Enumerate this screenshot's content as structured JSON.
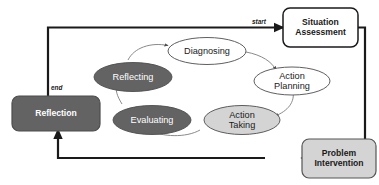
{
  "diagram": {
    "colors": {
      "dark_fill": "#636363",
      "light_fill": "#d4d4d4",
      "white_fill": "#ffffff",
      "stroke": "#1a1a1a",
      "thin_stroke": "#808080",
      "dark_text": "#ffffff",
      "light_text": "#1a1a1a"
    },
    "boxes": [
      {
        "id": "situation-assessment",
        "label": "Situation\nAssessment",
        "line1": "Situation",
        "line2": "Assessment",
        "fill": "#ffffff",
        "text_color": "#1a1a1a"
      },
      {
        "id": "problem-intervention",
        "label": "Problem\nIntervention",
        "line1": "Problem",
        "line2": "Intervention",
        "fill": "#d4d4d4",
        "text_color": "#1a1a1a"
      },
      {
        "id": "reflection",
        "label": "Reflection",
        "line1": "Reflection",
        "line2": "",
        "fill": "#636363",
        "text_color": "#ffffff"
      }
    ],
    "ellipses": [
      {
        "id": "diagnosing",
        "label": "Diagnosing",
        "line1": "Diagnosing",
        "line2": "",
        "fill": "#ffffff",
        "text_color": "#1a1a1a"
      },
      {
        "id": "action-planning",
        "label": "Action Planning",
        "line1": "Action",
        "line2": "Planning",
        "fill": "#ffffff",
        "text_color": "#1a1a1a"
      },
      {
        "id": "action-taking",
        "label": "Action Taking",
        "line1": "Action",
        "line2": "Taking",
        "fill": "#d4d4d4",
        "text_color": "#1a1a1a"
      },
      {
        "id": "evaluating",
        "label": "Evaluating",
        "line1": "Evaluating",
        "line2": "",
        "fill": "#636363",
        "text_color": "#ffffff"
      },
      {
        "id": "reflecting",
        "label": "Reflecting",
        "line1": "Reflecting",
        "line2": "",
        "fill": "#636363",
        "text_color": "#ffffff"
      }
    ],
    "edge_labels": {
      "start": "start",
      "end": "end"
    },
    "flow": [
      "Reflection -> Situation Assessment (start)",
      "Situation Assessment -> Problem Intervention",
      "Problem Intervention -> Reflection (end)",
      "Reflecting -> Diagnosing",
      "Diagnosing -> Action Planning",
      "Action Planning -> Action Taking",
      "Action Taking -> Evaluating",
      "Evaluating -> Reflecting"
    ]
  }
}
